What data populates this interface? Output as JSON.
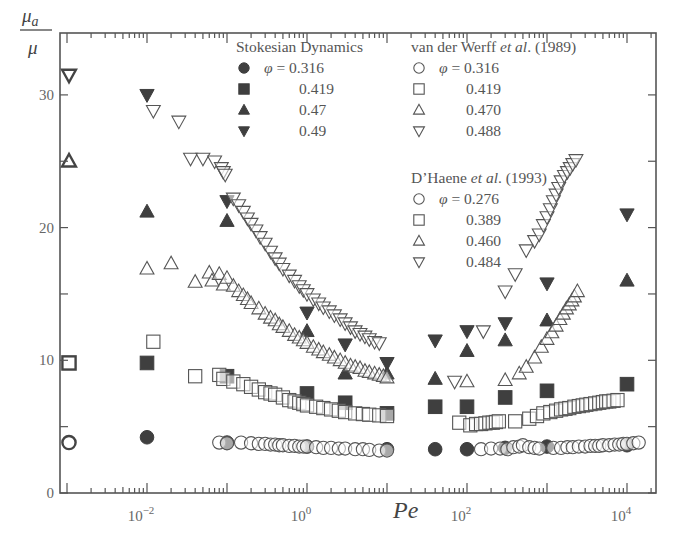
{
  "chart_data": {
    "type": "scatter",
    "title": "",
    "xlabel": "Pe",
    "ylabel": "μa/μ",
    "ylabel_numerator": "μ",
    "ylabel_numerator_sub": "a",
    "ylabel_denominator": "μ",
    "xscale": "log",
    "xlim": [
      0.0007,
      20000
    ],
    "ylim": [
      0,
      33
    ],
    "grid": false,
    "legend_position": "upper-right-inside",
    "x_tick_labels": [
      {
        "base": "10",
        "exp": "−2",
        "value": 0.01
      },
      {
        "base": "10",
        "exp": "0",
        "value": 1
      },
      {
        "base": "10",
        "exp": "2",
        "value": 100
      },
      {
        "base": "10",
        "exp": "4",
        "value": 10000
      }
    ],
    "y_tick_labels": [
      "0",
      "10",
      "20",
      "30"
    ],
    "y_major_ticks": [
      0,
      5,
      10,
      15,
      20,
      25,
      30
    ],
    "legend": {
      "groups": [
        {
          "title": "Stokesian Dynamics",
          "title_italic": "",
          "title_suffix": "",
          "entries": [
            {
              "marker": "filled-circle",
              "label": "φ = 0.316"
            },
            {
              "marker": "filled-square",
              "label": "0.419"
            },
            {
              "marker": "filled-triangle-up",
              "label": "0.47"
            },
            {
              "marker": "filled-triangle-down",
              "label": "0.49"
            }
          ]
        },
        {
          "title": "van der Werff ",
          "title_italic": "et al",
          "title_suffix": ". (1989)",
          "entries": [
            {
              "marker": "open-circle",
              "label": "φ = 0.316"
            },
            {
              "marker": "open-square",
              "label": "0.419"
            },
            {
              "marker": "open-triangle-up",
              "label": "0.470"
            },
            {
              "marker": "open-triangle-down",
              "label": "0.488"
            }
          ]
        },
        {
          "title": "D’Haene ",
          "title_italic": "et al",
          "title_suffix": ". (1993)",
          "entries": [
            {
              "marker": "open-circle",
              "label": "φ = 0.276"
            },
            {
              "marker": "open-square",
              "label": "0.389"
            },
            {
              "marker": "open-triangle-up",
              "label": "0.460"
            },
            {
              "marker": "open-triangle-down",
              "label": "0.484"
            }
          ]
        }
      ]
    },
    "zero_shear_points": [
      {
        "marker": "open-circle",
        "x": 0.001,
        "y": 3.8
      },
      {
        "marker": "open-square",
        "x": 0.001,
        "y": 9.8
      },
      {
        "marker": "open-triangle-up",
        "x": 0.001,
        "y": 25.0
      },
      {
        "marker": "open-triangle-down",
        "x": 0.001,
        "y": 31.5
      }
    ],
    "series": [
      {
        "name": "Stokesian Dynamics φ=0.316",
        "marker": "filled-circle",
        "x": [
          0.01,
          0.1,
          1,
          10,
          40,
          100,
          300,
          1000,
          10000
        ],
        "y": [
          4.2,
          3.8,
          3.5,
          3.3,
          3.3,
          3.3,
          3.4,
          3.5,
          3.6
        ]
      },
      {
        "name": "Stokesian Dynamics φ=0.419",
        "marker": "filled-square",
        "x": [
          0.01,
          0.1,
          1,
          3,
          10,
          40,
          100,
          300,
          1000,
          10000
        ],
        "y": [
          9.8,
          8.8,
          7.5,
          6.8,
          6.0,
          6.5,
          6.5,
          7.2,
          7.7,
          8.2
        ]
      },
      {
        "name": "Stokesian Dynamics φ=0.47",
        "marker": "filled-triangle-up",
        "x": [
          0.01,
          0.1,
          1,
          3,
          10,
          40,
          100,
          300,
          1000,
          10000
        ],
        "y": [
          21.2,
          20.5,
          12.2,
          9.0,
          9.0,
          8.6,
          10.7,
          11.5,
          13.0,
          16.0
        ]
      },
      {
        "name": "Stokesian Dynamics φ=0.49",
        "marker": "filled-triangle-down",
        "x": [
          0.01,
          0.1,
          1,
          3,
          10,
          40,
          100,
          300,
          1000,
          10000
        ],
        "y": [
          30.0,
          22.0,
          13.6,
          11.2,
          9.8,
          11.5,
          12.2,
          12.8,
          15.8,
          21.0
        ]
      },
      {
        "name": "van der Werff et al. (1989) φ=0.316 / D'Haene φ=0.276",
        "marker": "open-circle",
        "x": [
          0.08,
          0.1,
          0.15,
          0.2,
          0.25,
          0.3,
          0.35,
          0.4,
          0.45,
          0.5,
          0.6,
          0.7,
          0.8,
          0.9,
          1.0,
          1.3,
          1.6,
          2,
          2.5,
          3,
          4,
          5,
          6,
          8,
          10,
          150,
          200,
          260,
          320,
          380,
          450,
          500,
          600,
          700,
          800,
          1200,
          1500,
          1800,
          2100,
          2500,
          3000,
          3500,
          4000,
          4500,
          5000,
          6000,
          7000,
          8000,
          9000,
          10000,
          12000,
          14000
        ],
        "y": [
          3.8,
          3.75,
          3.8,
          3.75,
          3.7,
          3.7,
          3.65,
          3.65,
          3.6,
          3.6,
          3.55,
          3.55,
          3.5,
          3.5,
          3.5,
          3.45,
          3.4,
          3.4,
          3.35,
          3.35,
          3.3,
          3.3,
          3.25,
          3.2,
          3.2,
          3.3,
          3.35,
          3.35,
          3.3,
          3.45,
          3.5,
          3.6,
          3.45,
          3.4,
          3.35,
          3.4,
          3.4,
          3.45,
          3.45,
          3.5,
          3.5,
          3.55,
          3.55,
          3.55,
          3.6,
          3.6,
          3.65,
          3.65,
          3.7,
          3.7,
          3.75,
          3.8
        ]
      },
      {
        "name": "van der Werff et al. (1989) φ=0.419 / D'Haene φ=0.389",
        "marker": "open-square",
        "x": [
          0.012,
          0.04,
          0.08,
          0.09,
          0.12,
          0.16,
          0.2,
          0.25,
          0.3,
          0.35,
          0.4,
          0.5,
          0.6,
          0.7,
          0.8,
          0.9,
          1.0,
          1.3,
          1.6,
          2,
          2.5,
          3,
          4,
          5,
          6,
          8,
          10,
          80,
          110,
          130,
          150,
          170,
          190,
          210,
          230,
          250,
          400,
          600,
          750,
          900,
          1100,
          1300,
          1500,
          1700,
          1900,
          2200,
          2500,
          2800,
          3100,
          3500,
          4000,
          4500,
          5000,
          5500,
          6000,
          6800,
          7600
        ],
        "y": [
          11.4,
          8.8,
          8.9,
          8.6,
          8.4,
          8.2,
          8.0,
          7.8,
          7.6,
          7.5,
          7.4,
          7.2,
          7.0,
          6.9,
          6.8,
          6.7,
          6.6,
          6.5,
          6.4,
          6.3,
          6.2,
          6.1,
          6.0,
          5.95,
          5.9,
          5.85,
          5.8,
          5.3,
          5.1,
          5.2,
          5.2,
          5.25,
          5.3,
          5.3,
          5.35,
          5.4,
          5.4,
          5.6,
          5.8,
          6.0,
          6.1,
          6.2,
          6.3,
          6.35,
          6.4,
          6.5,
          6.55,
          6.6,
          6.65,
          6.7,
          6.75,
          6.8,
          6.85,
          6.9,
          6.9,
          6.95,
          7.0
        ]
      },
      {
        "name": "van der Werff et al. (1989) φ=0.470 / D'Haene φ=0.460",
        "marker": "open-triangle-up",
        "x": [
          0.01,
          0.02,
          0.04,
          0.06,
          0.065,
          0.08,
          0.09,
          0.1,
          0.12,
          0.14,
          0.16,
          0.18,
          0.2,
          0.25,
          0.3,
          0.35,
          0.4,
          0.45,
          0.5,
          0.6,
          0.7,
          0.8,
          0.9,
          1.0,
          1.2,
          1.4,
          1.6,
          1.9,
          2.2,
          2.6,
          3,
          3.5,
          4,
          4.6,
          5.3,
          6,
          7,
          8,
          9,
          10,
          100,
          300,
          450,
          550,
          700,
          850,
          1000,
          1150,
          1300,
          1450,
          1600,
          1750,
          1900,
          2050,
          2200,
          2400
        ],
        "y": [
          16.9,
          17.3,
          15.9,
          16.6,
          16.0,
          16.5,
          15.7,
          16.2,
          15.6,
          15.2,
          14.9,
          14.6,
          14.3,
          13.9,
          13.5,
          13.2,
          13.0,
          12.7,
          12.5,
          12.2,
          11.9,
          11.7,
          11.5,
          11.3,
          11.0,
          10.8,
          10.6,
          10.4,
          10.2,
          10.0,
          9.8,
          9.6,
          9.5,
          9.4,
          9.2,
          9.1,
          9.0,
          8.9,
          8.8,
          8.7,
          8.4,
          8.5,
          9.0,
          9.5,
          10.2,
          11.0,
          11.6,
          12.1,
          12.6,
          13.1,
          13.5,
          13.9,
          14.2,
          14.5,
          14.8,
          15.2
        ]
      },
      {
        "name": "van der Werff et al. (1989) φ=0.488 / D'Haene φ=0.484",
        "marker": "open-triangle-down",
        "x": [
          0.012,
          0.025,
          0.035,
          0.05,
          0.07,
          0.085,
          0.09,
          0.095,
          0.12,
          0.14,
          0.16,
          0.18,
          0.2,
          0.23,
          0.26,
          0.3,
          0.35,
          0.4,
          0.45,
          0.5,
          0.6,
          0.7,
          0.8,
          0.9,
          1.0,
          1.2,
          1.4,
          1.6,
          1.9,
          2.2,
          2.6,
          3,
          3.5,
          4,
          4.6,
          5.3,
          6,
          7,
          8,
          70,
          160,
          300,
          400,
          550,
          700,
          800,
          900,
          1000,
          1100,
          1200,
          1300,
          1400,
          1500,
          1650,
          1800,
          1950,
          2100,
          2300
        ],
        "y": [
          28.8,
          28.0,
          25.2,
          25.2,
          25.0,
          24.5,
          24.2,
          24.0,
          22.2,
          21.7,
          21.2,
          20.7,
          20.3,
          19.8,
          19.3,
          18.8,
          18.2,
          17.7,
          17.3,
          16.9,
          16.4,
          16.0,
          15.6,
          15.3,
          15.0,
          14.6,
          14.3,
          14.0,
          13.7,
          13.4,
          13.1,
          12.8,
          12.5,
          12.2,
          12.0,
          11.8,
          11.6,
          11.4,
          11.3,
          8.4,
          12.2,
          15.2,
          16.5,
          18.3,
          19.0,
          19.5,
          20.2,
          20.8,
          21.4,
          22.0,
          22.5,
          23.0,
          23.5,
          23.9,
          24.2,
          24.5,
          24.8,
          25.1
        ]
      }
    ]
  }
}
